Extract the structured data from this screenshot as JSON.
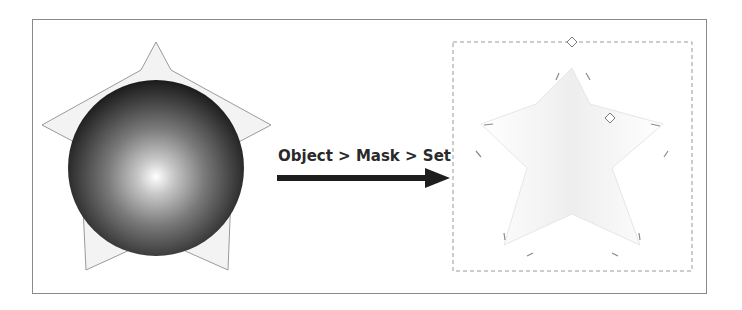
{
  "diagram": {
    "caption": "Object > Mask > Set",
    "before": {
      "description": "Radial-gradient sphere placed over a star outline",
      "sphere_gradient": [
        "#ffffff",
        "#8c8c8c",
        "#3a3a3a",
        "#1c1c1c"
      ],
      "star_fill": "#f2f2f2",
      "star_stroke": "#9a9a9a"
    },
    "after": {
      "description": "Masked result: faint star shape inside a dashed selection box with diamond handles",
      "selection_stroke": "#9a9a9a",
      "handle_count": 2
    },
    "arrow_color": "#1e1e1e"
  }
}
